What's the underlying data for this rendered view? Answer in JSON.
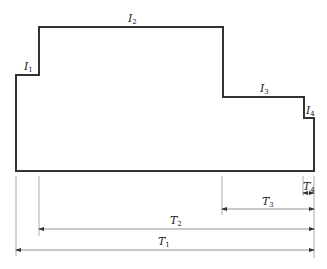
{
  "diagram": {
    "type": "stepped load/current profile with time dimensions",
    "profile_levels": [
      {
        "label": "I",
        "sub": "1"
      },
      {
        "label": "I",
        "sub": "2"
      },
      {
        "label": "I",
        "sub": "3"
      },
      {
        "label": "I",
        "sub": "4"
      }
    ],
    "durations": [
      {
        "label": "T",
        "sub": "1"
      },
      {
        "label": "T",
        "sub": "2"
      },
      {
        "label": "T",
        "sub": "3"
      },
      {
        "label": "T",
        "sub": "4"
      }
    ],
    "colors": {
      "profile": "#333333",
      "dimension": "#888888"
    }
  }
}
